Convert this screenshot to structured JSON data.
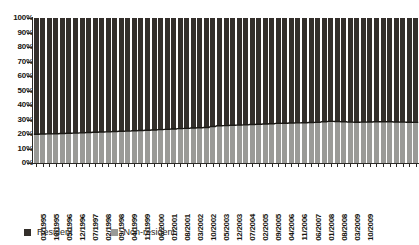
{
  "chart_data": {
    "type": "bar",
    "subtype": "100% stacked bar",
    "title": "",
    "subtitle": "",
    "xlabel": "",
    "ylabel": "",
    "ylim": [
      0,
      100
    ],
    "y_unit": "%",
    "grid": false,
    "legend_position": "bottom-left",
    "y_ticks": [
      "0%",
      "10%",
      "20%",
      "30%",
      "40%",
      "50%",
      "60%",
      "70%",
      "80%",
      "90%",
      "100%"
    ],
    "y_tick_values": [
      0,
      10,
      20,
      30,
      40,
      50,
      60,
      70,
      80,
      90,
      100
    ],
    "x_tick_labels": [
      "03/1995",
      "10/1995",
      "05/1996",
      "12/1996",
      "07/1997",
      "02/1998",
      "09/1998",
      "04/1999",
      "11/1999",
      "06/2000",
      "01/2001",
      "08/2001",
      "03/2002",
      "10/2002",
      "05/2003",
      "12/2003",
      "07/2004",
      "02/2005",
      "09/2005",
      "04/2006",
      "11/2006",
      "06/2007",
      "01/2008",
      "08/2008",
      "03/2009",
      "10/2009"
    ],
    "x_tick_every": 2,
    "categories": [
      "03/1995",
      "06/1995",
      "09/1995",
      "12/1995",
      "03/1996",
      "06/1996",
      "09/1996",
      "12/1996",
      "03/1997",
      "06/1997",
      "09/1997",
      "12/1997",
      "03/1998",
      "06/1998",
      "09/1998",
      "12/1998",
      "03/1999",
      "06/1999",
      "09/1999",
      "12/1999",
      "03/2000",
      "06/2000",
      "09/2000",
      "12/2000",
      "03/2001",
      "06/2001",
      "09/2001",
      "12/2001",
      "03/2002",
      "06/2002",
      "09/2002",
      "12/2002",
      "03/2003",
      "06/2003",
      "09/2003",
      "12/2003",
      "03/2004",
      "06/2004",
      "09/2004",
      "12/2004",
      "03/2005",
      "06/2005",
      "09/2005",
      "12/2005",
      "03/2006",
      "06/2006",
      "09/2006",
      "12/2006",
      "03/2007",
      "06/2007",
      "09/2007",
      "12/2007",
      "03/2008",
      "06/2008",
      "09/2008",
      "12/2008",
      "03/2009",
      "06/2009",
      "10/2009"
    ],
    "series": [
      {
        "name": "Resident",
        "color": "#332f2b",
        "stack_position": "top",
        "values": [
          80.2,
          80.0,
          79.9,
          79.8,
          79.7,
          79.5,
          79.4,
          79.2,
          79.0,
          78.8,
          78.6,
          78.5,
          78.3,
          78.1,
          78.0,
          77.8,
          77.6,
          77.4,
          77.2,
          77.0,
          76.8,
          76.5,
          76.3,
          76.1,
          75.9,
          75.7,
          75.5,
          74.8,
          74.3,
          74.2,
          74.0,
          73.9,
          73.7,
          73.5,
          73.3,
          73.1,
          72.9,
          72.7,
          72.6,
          72.4,
          72.3,
          72.2,
          72.1,
          72.0,
          71.5,
          71.3,
          71.4,
          71.6,
          71.8,
          71.9,
          71.8,
          71.7,
          71.6,
          71.5,
          71.6,
          71.7,
          71.8,
          71.9,
          72.0
        ]
      },
      {
        "name": "Non-resident",
        "color": "#9a9a97",
        "stack_position": "bottom",
        "values": [
          19.8,
          20.0,
          20.1,
          20.2,
          20.3,
          20.5,
          20.6,
          20.8,
          21.0,
          21.2,
          21.4,
          21.5,
          21.7,
          21.9,
          22.0,
          22.2,
          22.4,
          22.6,
          22.8,
          23.0,
          23.2,
          23.5,
          23.7,
          23.9,
          24.1,
          24.3,
          24.5,
          25.2,
          25.7,
          25.8,
          26.0,
          26.1,
          26.3,
          26.5,
          26.7,
          26.9,
          27.1,
          27.3,
          27.4,
          27.6,
          27.7,
          27.8,
          27.9,
          28.0,
          28.5,
          28.7,
          28.6,
          28.4,
          28.2,
          28.1,
          28.2,
          28.3,
          28.4,
          28.5,
          28.4,
          28.3,
          28.2,
          28.1,
          28.0
        ]
      }
    ]
  },
  "legend": {
    "items": [
      {
        "label": "Resident",
        "color": "#332f2b"
      },
      {
        "label": "Non-resident",
        "color": "#9a9a97"
      }
    ]
  },
  "colors": {
    "axis": "#2b2926",
    "boundary_line": "#1a1814",
    "resident": "#332f2b",
    "non_resident": "#9a9a97",
    "background": "#ffffff",
    "tick_text": "#17150f"
  }
}
